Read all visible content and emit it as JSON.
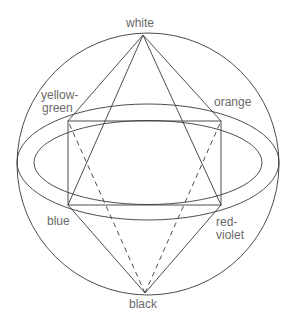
{
  "diagram": {
    "labels": {
      "top": "white",
      "bottom": "black",
      "upper_left_1": "yellow-",
      "upper_left_2": "green",
      "upper_right": "orange",
      "lower_left": "blue",
      "lower_right_1": "red-",
      "lower_right_2": "violet"
    },
    "colors": {
      "stroke": "#3a3a3a",
      "text": "#6a6a6a",
      "background": "#ffffff"
    }
  }
}
